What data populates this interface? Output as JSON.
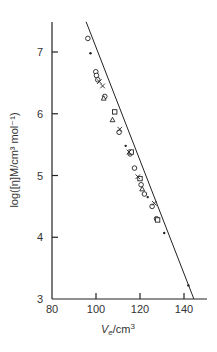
{
  "chart_data": {
    "type": "scatter",
    "title": "",
    "xlabel": "V_e/cm^3",
    "ylabel": "log([η]M/cm^3 mol^-1)",
    "xlim": [
      80,
      150
    ],
    "ylim": [
      3,
      7.5
    ],
    "xticks": [
      80,
      100,
      120,
      140
    ],
    "yticks": [
      3,
      4,
      5,
      6,
      7
    ],
    "grid": false,
    "legend": null,
    "fit_line": {
      "x": [
        95.5,
        144.5
      ],
      "y": [
        7.49,
        3.0
      ]
    },
    "series": [
      {
        "name": "circles",
        "marker": "o",
        "points": [
          [
            96.3,
            7.22
          ],
          [
            99.9,
            6.68
          ],
          [
            100.2,
            6.62
          ],
          [
            100.8,
            6.55
          ],
          [
            104,
            6.28
          ],
          [
            110.5,
            5.7
          ],
          [
            115.5,
            5.35
          ],
          [
            117.5,
            5.12
          ],
          [
            120.5,
            4.85
          ],
          [
            122,
            4.7
          ],
          [
            125.5,
            4.5
          ],
          [
            127.5,
            4.3
          ]
        ]
      },
      {
        "name": "squares",
        "marker": "s",
        "points": [
          [
            108.5,
            6.03
          ],
          [
            116,
            5.38
          ],
          [
            120,
            4.95
          ],
          [
            128,
            4.28
          ]
        ]
      },
      {
        "name": "crosses",
        "marker": "x",
        "points": [
          [
            101.5,
            6.52
          ],
          [
            103,
            6.45
          ],
          [
            110.8,
            5.75
          ],
          [
            115,
            5.38
          ],
          [
            119,
            4.98
          ],
          [
            126.5,
            4.55
          ]
        ]
      },
      {
        "name": "triangles",
        "marker": "^",
        "points": [
          [
            107.5,
            5.9
          ],
          [
            103.5,
            6.25
          ],
          [
            121,
            4.78
          ]
        ]
      },
      {
        "name": "dots",
        "marker": ".",
        "points": [
          [
            97.5,
            6.98
          ],
          [
            113.5,
            5.48
          ],
          [
            123.5,
            4.65
          ],
          [
            131,
            4.07
          ],
          [
            142,
            3.22
          ]
        ]
      }
    ]
  },
  "axes": {
    "x_title_main": "V",
    "x_title_sub": "e",
    "x_title_unit": "/cm",
    "x_title_sup": "3",
    "y_title": "log([η]M/cm³ mol⁻¹)",
    "x_tick_labels": [
      "80",
      "100",
      "120",
      "140"
    ],
    "y_tick_labels": [
      "3",
      "4",
      "5",
      "6",
      "7"
    ]
  },
  "colors": {
    "ink": "#222222",
    "text": "#333333"
  }
}
